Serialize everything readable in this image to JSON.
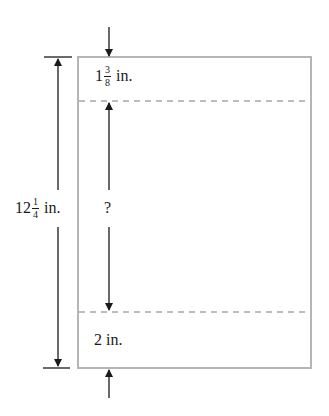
{
  "diagram": {
    "type": "paper-margin-dimension-diagram",
    "shape": "rectangle (sheet of paper)",
    "colors": {
      "lines": "#1a1a1a",
      "paper_border": "#b5b5b5",
      "dashed_margin_lines": "#a8a8a8",
      "background": "#ffffff"
    },
    "labels": {
      "total_height": {
        "whole": "12",
        "numerator": "1",
        "denominator": "4",
        "unit": "in."
      },
      "top_margin": {
        "whole": "1",
        "numerator": "3",
        "denominator": "8",
        "unit": "in."
      },
      "unknown": "?",
      "bottom_margin": {
        "whole": "2",
        "unit": "in."
      }
    }
  }
}
